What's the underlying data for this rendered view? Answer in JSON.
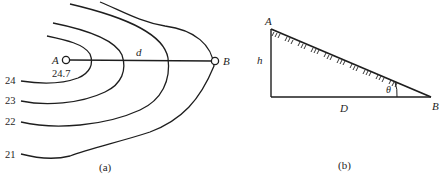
{
  "figure_a": {
    "caption": "(a)",
    "point_a": {
      "label": "A",
      "elevation": "24.7"
    },
    "point_b": {
      "label": "B"
    },
    "distance_label": "d",
    "contours": [
      {
        "value": "24"
      },
      {
        "value": "23"
      },
      {
        "value": "22"
      },
      {
        "value": "21"
      }
    ]
  },
  "figure_b": {
    "caption": "(b)",
    "vertex_top": "A",
    "vertex_right": "B",
    "height_label": "h",
    "base_label": "D",
    "angle_label": "θ"
  },
  "colors": {
    "line": "#1e1e1e",
    "background": "#ffffff"
  }
}
